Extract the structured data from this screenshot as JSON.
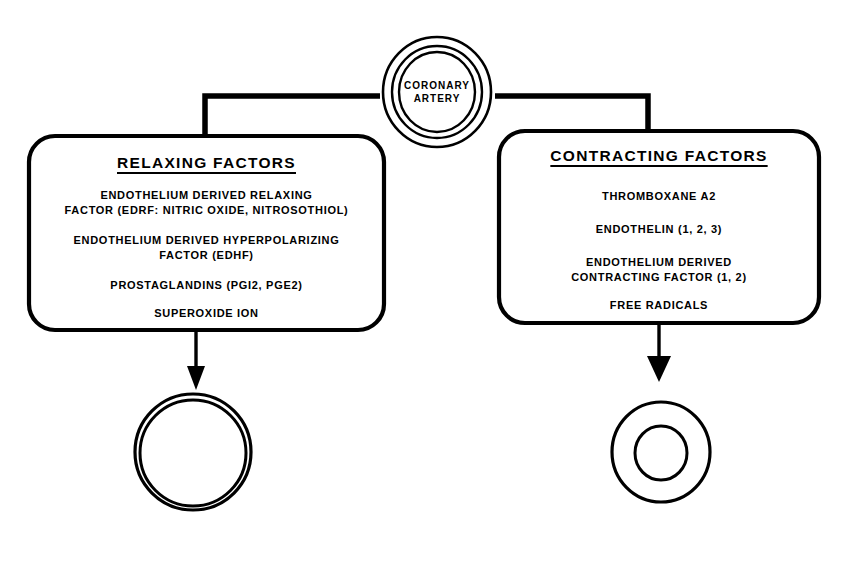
{
  "figure": {
    "type": "flow-diagram",
    "background_color": "#ffffff",
    "line_color": "#000000"
  },
  "source_node": {
    "label_line_1": "CORONARY",
    "label_line_2": "ARTERY",
    "icon": "concentric-rings-vessel-cross-section"
  },
  "branches": [
    {
      "id": "relaxing",
      "title": "RELAXING FACTORS",
      "items": [
        {
          "lines": [
            "ENDOTHELIUM DERIVED RELAXING",
            "FACTOR (EDRF: NITRIC OXIDE, NITROSOTHIOL)"
          ]
        },
        {
          "lines": [
            "ENDOTHELIUM DERIVED HYPERPOLARIZING",
            "FACTOR (EDHF)"
          ]
        },
        {
          "lines": [
            "PROSTAGLANDINS (PGI2, PGE2)"
          ]
        },
        {
          "lines": [
            "SUPEROXIDE ION"
          ]
        }
      ],
      "outcome": {
        "icon": "vessel-cross-section-dilated",
        "description": "thin walled vessel with wide lumen"
      }
    },
    {
      "id": "contracting",
      "title": "CONTRACTING FACTORS",
      "items": [
        {
          "lines": [
            "THROMBOXANE A2"
          ]
        },
        {
          "lines": [
            "ENDOTHELIN (1, 2, 3)"
          ]
        },
        {
          "lines": [
            "ENDOTHELIUM DERIVED",
            "CONTRACTING FACTOR (1, 2)"
          ]
        },
        {
          "lines": [
            "FREE RADICALS"
          ]
        }
      ],
      "outcome": {
        "icon": "vessel-cross-section-constricted",
        "description": "thick walled vessel with narrow lumen"
      }
    }
  ]
}
